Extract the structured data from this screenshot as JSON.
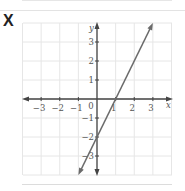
{
  "option_label": "X",
  "chart_data": {
    "type": "line",
    "title": "",
    "xlabel": "x",
    "ylabel": "y",
    "xlim": [
      -4,
      4
    ],
    "ylim": [
      -4,
      4
    ],
    "grid": true,
    "x_ticks": [
      "-3",
      "-2",
      "-1",
      "1",
      "2",
      "3"
    ],
    "y_ticks": [
      "3",
      "2",
      "1",
      "-1",
      "-2",
      "-3"
    ],
    "origin_label": "0",
    "series": [
      {
        "name": "line",
        "equation": "y = 2x - 2",
        "x": [
          -1,
          0,
          1,
          2,
          3
        ],
        "y": [
          -4,
          -2,
          0,
          2,
          4
        ]
      }
    ],
    "colors": {
      "line": "#6b6b6b",
      "axis": "#444444",
      "grid": "#e6e6e6"
    }
  }
}
